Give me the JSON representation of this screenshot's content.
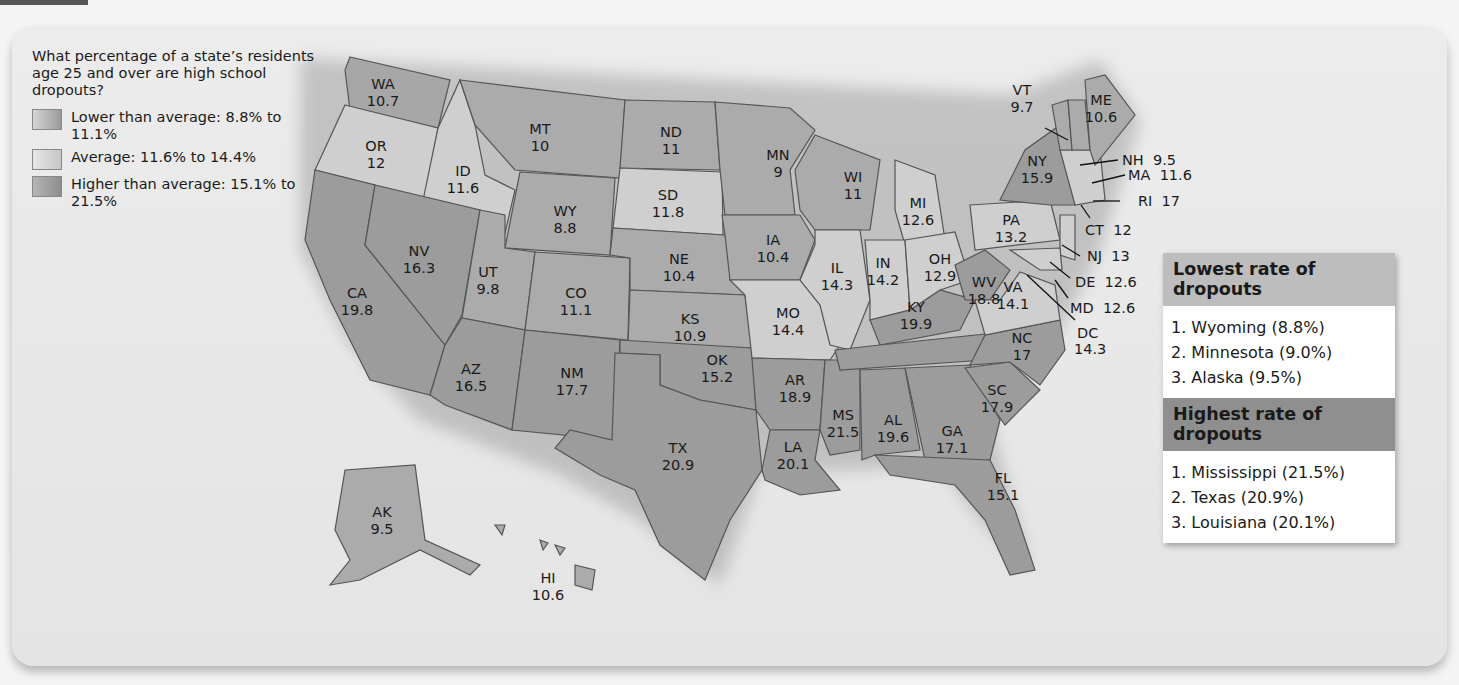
{
  "legend": {
    "question": "What percentage of a state’s residents age 25 and over are high school dropouts?",
    "items": [
      {
        "label": "Lower than average: 8.8% to 11.1%",
        "color": "#a9a9a9"
      },
      {
        "label": "Average: 11.6% to 14.4%",
        "color": "#d2d2d2"
      },
      {
        "label": "Higher than average: 15.1% to 21.5%",
        "color": "#9a9a9a"
      }
    ]
  },
  "lowest": {
    "title": "Lowest rate of dropouts",
    "items": [
      "1. Wyoming (8.8%)",
      "2. Minnesota (9.0%)",
      "3. Alaska (9.5%)"
    ]
  },
  "highest": {
    "title": "Highest rate of dropouts",
    "items": [
      "1. Mississippi (21.5%)",
      "2. Texas (20.9%)",
      "3. Louisiana (20.1%)"
    ]
  },
  "chart_data": {
    "type": "choropleth",
    "title": "What percentage of a state’s residents age 25 and over are high school dropouts?",
    "categories": [
      "Lower than average: 8.8% to 11.1%",
      "Average: 11.6% to 14.4%",
      "Higher than average: 15.1% to 21.5%"
    ],
    "values": {
      "WA": 10.7,
      "OR": 12,
      "CA": 19.8,
      "ID": 11.6,
      "NV": 16.3,
      "MT": 10,
      "WY": 8.8,
      "UT": 9.8,
      "AZ": 16.5,
      "CO": 11.1,
      "NM": 17.7,
      "ND": 11,
      "SD": 11.8,
      "NE": 10.4,
      "KS": 10.9,
      "OK": 15.2,
      "TX": 20.9,
      "MN": 9,
      "IA": 10.4,
      "MO": 14.4,
      "AR": 18.9,
      "LA": 20.1,
      "WI": 11,
      "IL": 14.3,
      "MS": 21.5,
      "MI": 12.6,
      "IN": 14.2,
      "KY": 19.9,
      "TN": 18.6,
      "AL": 19.6,
      "OH": 12.9,
      "WV": 18.8,
      "GA": 17.1,
      "FL": 15.1,
      "SC": 17.9,
      "NC": 17,
      "VA": 14.1,
      "DC": 14.3,
      "MD": 12.6,
      "DE": 12.6,
      "NJ": 13,
      "PA": 13.2,
      "NY": 15.9,
      "CT": 12,
      "RI": 17,
      "MA": 11.6,
      "NH": 9.5,
      "VT": 9.7,
      "ME": 10.6,
      "AK": 9.5,
      "HI": 10.6
    },
    "lowest": [
      [
        "Wyoming",
        8.8
      ],
      [
        "Minnesota",
        9.0
      ],
      [
        "Alaska",
        9.5
      ]
    ],
    "highest": [
      [
        "Mississippi",
        21.5
      ],
      [
        "Texas",
        20.9
      ],
      [
        "Louisiana",
        20.1
      ]
    ]
  },
  "labels": [
    {
      "s": "WA",
      "v": "10.7",
      "x": 383,
      "y": 89
    },
    {
      "s": "OR",
      "v": "12",
      "x": 376,
      "y": 151
    },
    {
      "s": "CA",
      "v": "19.8",
      "x": 357,
      "y": 298
    },
    {
      "s": "ID",
      "v": "11.6",
      "x": 463,
      "y": 176
    },
    {
      "s": "NV",
      "v": "16.3",
      "x": 419,
      "y": 256
    },
    {
      "s": "MT",
      "v": "10",
      "x": 540,
      "y": 134
    },
    {
      "s": "WY",
      "v": "8.8",
      "x": 565,
      "y": 216
    },
    {
      "s": "UT",
      "v": "9.8",
      "x": 488,
      "y": 277
    },
    {
      "s": "AZ",
      "v": "16.5",
      "x": 471,
      "y": 374
    },
    {
      "s": "CO",
      "v": "11.1",
      "x": 576,
      "y": 298
    },
    {
      "s": "NM",
      "v": "17.7",
      "x": 572,
      "y": 378
    },
    {
      "s": "ND",
      "v": "11",
      "x": 671,
      "y": 137
    },
    {
      "s": "SD",
      "v": "11.8",
      "x": 668,
      "y": 200
    },
    {
      "s": "NE",
      "v": "10.4",
      "x": 679,
      "y": 264
    },
    {
      "s": "KS",
      "v": "10.9",
      "x": 690,
      "y": 324
    },
    {
      "s": "OK",
      "v": "15.2",
      "x": 717,
      "y": 365
    },
    {
      "s": "TX",
      "v": "20.9",
      "x": 678,
      "y": 453
    },
    {
      "s": "MN",
      "v": "9",
      "x": 778,
      "y": 160
    },
    {
      "s": "IA",
      "v": "10.4",
      "x": 773,
      "y": 245
    },
    {
      "s": "MO",
      "v": "14.4",
      "x": 788,
      "y": 318
    },
    {
      "s": "AR",
      "v": "18.9",
      "x": 795,
      "y": 385
    },
    {
      "s": "LA",
      "v": "20.1",
      "x": 793,
      "y": 452
    },
    {
      "s": "WI",
      "v": "11",
      "x": 853,
      "y": 182
    },
    {
      "s": "IL",
      "v": "14.3",
      "x": 837,
      "y": 273
    },
    {
      "s": "MS",
      "v": "21.5",
      "x": 843,
      "y": 420
    },
    {
      "s": "MI",
      "v": "12.6",
      "x": 918,
      "y": 208
    },
    {
      "s": "IN",
      "v": "14.2",
      "x": 883,
      "y": 268
    },
    {
      "s": "KY",
      "v": "19.9",
      "x": 916,
      "y": 312
    },
    {
      "s": "AL",
      "v": "19.6",
      "x": 893,
      "y": 425
    },
    {
      "s": "OH",
      "v": "12.9",
      "x": 940,
      "y": 264
    },
    {
      "s": "WV",
      "v": "18.8",
      "x": 984,
      "y": 287
    },
    {
      "s": "GA",
      "v": "17.1",
      "x": 952,
      "y": 436
    },
    {
      "s": "FL",
      "v": "15.1",
      "x": 1003,
      "y": 483
    },
    {
      "s": "SC",
      "v": "17.9",
      "x": 997,
      "y": 395
    },
    {
      "s": "NC",
      "v": "17",
      "x": 1022,
      "y": 343
    },
    {
      "s": "VA",
      "v": "14.1",
      "x": 1013,
      "y": 292
    },
    {
      "s": "PA",
      "v": "13.2",
      "x": 1011,
      "y": 225
    },
    {
      "s": "NY",
      "v": "15.9",
      "x": 1037,
      "y": 166
    },
    {
      "s": "ME",
      "v": "10.6",
      "x": 1101,
      "y": 105
    },
    {
      "s": "VT",
      "v": "9.7",
      "x": 1022,
      "y": 95
    },
    {
      "s": "AK",
      "v": "9.5",
      "x": 382,
      "y": 517
    },
    {
      "s": "HI",
      "v": "10.6",
      "x": 548,
      "y": 583
    }
  ],
  "callouts": [
    {
      "t": "NH  9.5",
      "x": 1122,
      "y": 165
    },
    {
      "t": "MA  11.6",
      "x": 1128,
      "y": 180
    },
    {
      "t": "RI  17",
      "x": 1138,
      "y": 206
    },
    {
      "t": "CT  12",
      "x": 1085,
      "y": 235
    },
    {
      "t": "NJ  13",
      "x": 1087,
      "y": 261
    },
    {
      "t": "DE  12.6",
      "x": 1075,
      "y": 287
    },
    {
      "t": "MD  12.6",
      "x": 1070,
      "y": 313
    },
    {
      "t": "DC",
      "x": 1077,
      "y": 338
    },
    {
      "t": "14.3",
      "x": 1074,
      "y": 354
    }
  ]
}
